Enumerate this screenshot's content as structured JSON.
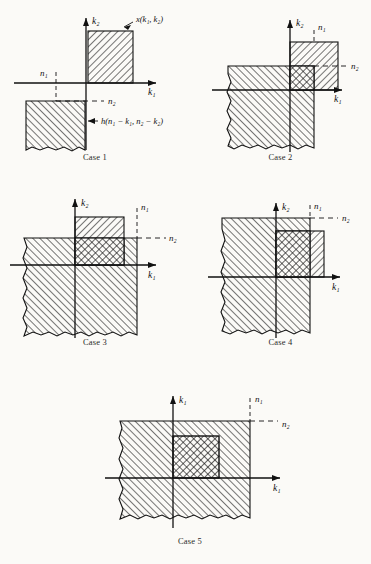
{
  "figure": {
    "background_color": "#fbfaf7",
    "ink_color": "#111111",
    "panel_count": 5
  },
  "labels": {
    "axis_k1": "k₁",
    "axis_k2": "k₂",
    "n1": "n₁",
    "n2": "n₂",
    "x_signal": "x(k₁, k₂)",
    "h_signal": "h(n₁ − k₁, n₂ − k₂)",
    "case1": "Case 1",
    "case2": "Case 2",
    "case3": "Case 3",
    "case4": "Case 4",
    "case5": "Case 5"
  },
  "panels": [
    {
      "id": "case-1",
      "caption": "Case 1",
      "vertical_axis_label": "k₂",
      "horizontal_axis_label": "k₁",
      "n1_label": "n₁",
      "n2_label": "n₂",
      "annotations": [
        "x(k₁, k₂)",
        "h(n₁ − k₁, n₂ − k₂)"
      ],
      "overlap": "none",
      "description": "x region in first quadrant, h region in third quadrant, no intersection"
    },
    {
      "id": "case-2",
      "caption": "Case 2",
      "vertical_axis_label": "k₂",
      "horizontal_axis_label": "k₁",
      "n1_label": "n₁",
      "n2_label": "n₂",
      "annotations": [],
      "overlap": "partial",
      "description": "h region overlaps lower-left portion of x region"
    },
    {
      "id": "case-3",
      "caption": "Case 3",
      "vertical_axis_label": "k₂",
      "horizontal_axis_label": "k₁",
      "n1_label": "n₁",
      "n2_label": "n₂",
      "annotations": [],
      "overlap": "partial",
      "description": "h region covers full width of x region below n₂"
    },
    {
      "id": "case-4",
      "caption": "Case 4",
      "vertical_axis_label": "k₂",
      "horizontal_axis_label": "k₁",
      "n1_label": "n₁",
      "n2_label": "n₂",
      "annotations": [],
      "overlap": "partial",
      "description": "h region covers x region left of n₁ and full height"
    },
    {
      "id": "case-5",
      "caption": "Case 5",
      "vertical_axis_label": "k₁",
      "horizontal_axis_label": "k₁",
      "n1_label": "n₁",
      "n2_label": "n₂",
      "annotations": [],
      "overlap": "complete",
      "description": "h region fully contains x region"
    }
  ]
}
